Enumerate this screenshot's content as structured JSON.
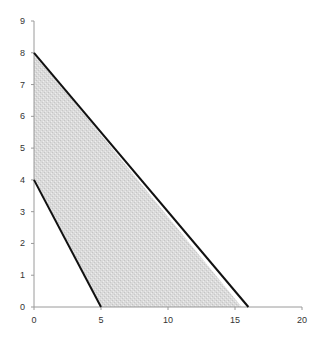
{
  "chart_data": {
    "type": "area",
    "title": "",
    "xlabel": "",
    "ylabel": "",
    "xlim": [
      0,
      20
    ],
    "ylim": [
      0,
      9
    ],
    "grid": false,
    "legend": null,
    "x_ticks": [
      "0",
      "5",
      "10",
      "15",
      "20"
    ],
    "y_ticks": [
      "0",
      "1",
      "2",
      "3",
      "4",
      "5",
      "6",
      "7",
      "8",
      "9"
    ],
    "series": [
      {
        "name": "upper-constraint-line",
        "type": "line",
        "points": [
          [
            0,
            8
          ],
          [
            16,
            0
          ]
        ],
        "color": "#111111"
      },
      {
        "name": "lower-constraint-line",
        "type": "line",
        "points": [
          [
            0,
            4
          ],
          [
            5,
            0
          ]
        ],
        "color": "#111111"
      }
    ],
    "feasible_region": {
      "type": "polygon",
      "points": [
        [
          0,
          4
        ],
        [
          0,
          8
        ],
        [
          15.5,
          0
        ],
        [
          5,
          0
        ]
      ],
      "fill": "#d6d6d6"
    }
  },
  "colors": {
    "axis": "#9a9a9a",
    "line": "#111111",
    "fill": "#d6d6d6"
  }
}
